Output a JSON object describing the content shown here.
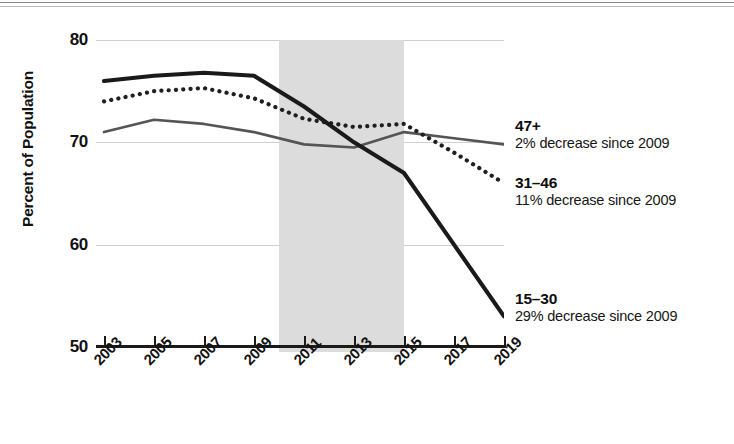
{
  "chart_data": {
    "type": "line",
    "title": "",
    "subtitle": "",
    "xlabel": "",
    "ylabel": "Percent of Population",
    "xlim": [
      2003,
      2019
    ],
    "ylim": [
      50,
      80
    ],
    "ytick_labels": [
      "80",
      "70",
      "60",
      "50"
    ],
    "ytick_values": [
      80,
      70,
      60,
      50
    ],
    "ygrid_values": [
      80,
      70,
      60
    ],
    "grid": true,
    "legend_position": "right-inline-labels",
    "xtick_labels": [
      "2003",
      "2005",
      "2007",
      "2009",
      "2011",
      "2013",
      "2015",
      "2017",
      "2019"
    ],
    "xtick_values": [
      2003,
      2005,
      2007,
      2009,
      2011,
      2013,
      2015,
      2017,
      2019
    ],
    "x": [
      2003,
      2005,
      2007,
      2009,
      2011,
      2013,
      2015,
      2017,
      2019
    ],
    "series": [
      {
        "name": "15–30",
        "note": "29% decrease since 2009",
        "style": "solid-thick",
        "color": "#1a1a1a",
        "values": [
          76.0,
          76.5,
          76.8,
          76.5,
          73.5,
          70.0,
          67.0,
          60.0,
          53.0
        ]
      },
      {
        "name": "31–46",
        "note": "11% decrease since 2009",
        "style": "dotted",
        "color": "#1f1f1f",
        "values": [
          74.0,
          75.0,
          75.3,
          74.3,
          72.3,
          71.5,
          71.8,
          69.0,
          66.0
        ]
      },
      {
        "name": "47+",
        "note": "2% decrease since 2009",
        "style": "solid-medium-gray",
        "color": "#555555",
        "values": [
          71.0,
          72.2,
          71.8,
          71.0,
          69.8,
          69.5,
          71.0,
          70.4,
          69.8
        ]
      }
    ],
    "shaded_region": {
      "label": "",
      "x_start": 2010,
      "x_end": 2015,
      "color": "#dcdcdc"
    },
    "annotations": [
      {
        "series": "47+",
        "label": "47+",
        "note": "2% decrease since 2009"
      },
      {
        "series": "31–46",
        "label": "31–46",
        "note": "11% decrease since 2009"
      },
      {
        "series": "15–30",
        "label": "15–30",
        "note": "29% decrease since 2009"
      }
    ]
  },
  "axis": {
    "y_title": "Percent of Population"
  },
  "colors": {
    "axis": "#1a1a1a",
    "gridline": "#cfcfcf",
    "band": "#dcdcdc",
    "series_15_30": "#1a1a1a",
    "series_31_46": "#1f1f1f",
    "series_47_plus": "#555555"
  }
}
